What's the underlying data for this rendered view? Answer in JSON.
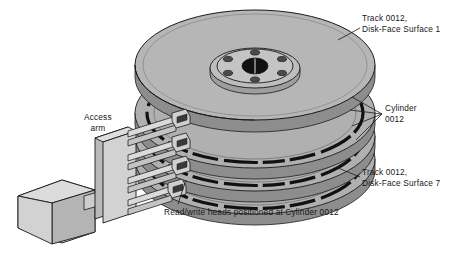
{
  "diagram": {
    "labels": {
      "track_top": "Track 0012,\nDisk-Face Surface 1",
      "cylinder": "Cylinder\n0012",
      "track_bottom": "Track 0012,\nDisk-Face Surface 7",
      "access_arm": "Access\narm",
      "read_write_heads": "Read/write heads positioned at Cylinder 0012"
    },
    "values": {
      "track_number": "0012",
      "cylinder_number": "0012",
      "top_surface_number": "1",
      "bottom_surface_number": "7",
      "platter_count": 4,
      "head_arm_count": 4,
      "hub_bolt_holes": 6
    },
    "colors": {
      "background": "#ffffff",
      "platter_top_face": "#b6b6b6",
      "platter_edge": "#9a9a9a",
      "platter_shadow": "#8d8d8d",
      "track_band": "#111111",
      "hub_face": "#c4c4c4",
      "arm_face": "#cfcfcf",
      "arm_side": "#a8a8a8",
      "outline": "#1a1a1a",
      "text": "#17181a"
    }
  }
}
